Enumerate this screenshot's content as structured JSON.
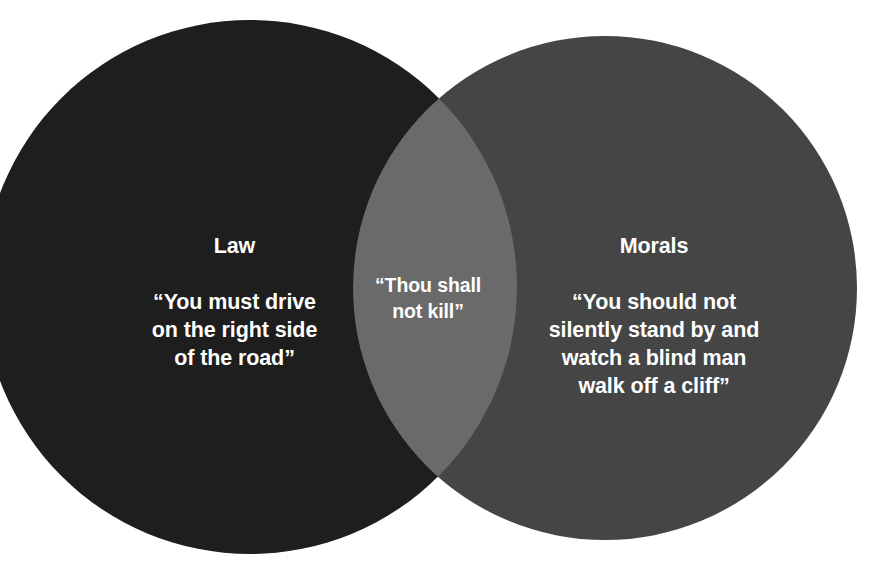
{
  "diagram": {
    "type": "venn",
    "background_color": "#ffffff",
    "sets": [
      {
        "id": "law",
        "title": "Law",
        "body": "“You must drive\non the right side\nof the road”",
        "fill_color": "#1e1e1e",
        "text_color": "#ffffff",
        "center_x": 250,
        "center_y": 287,
        "radius": 267
      },
      {
        "id": "morals",
        "title": "Morals",
        "body": "“You should not\nsilently stand by and\nwatch a blind man\nwalk off a cliff”",
        "fill_color": "#454545",
        "text_color": "#ffffff",
        "center_x": 605,
        "center_y": 288,
        "radius": 252
      }
    ],
    "intersection": {
      "id": "law-and-morals",
      "body": "“Thou shall\nnot kill”",
      "fill_color": "#6a6a6a",
      "text_color": "#ffffff",
      "top_point_x": 440,
      "top_point_y": 83,
      "bottom_point_x": 440,
      "bottom_point_y": 490
    }
  }
}
